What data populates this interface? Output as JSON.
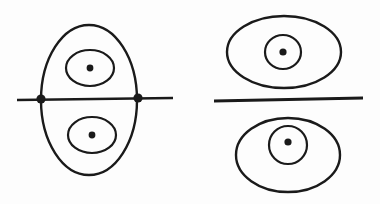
{
  "figure": {
    "name": "nodal-curve-degeneration-diagram",
    "background_color": "#fdfdfd",
    "ink_color": "#1a1a1a",
    "width": 380,
    "height": 204
  },
  "panels": [
    {
      "id": "left-panel",
      "label": "left-configuration",
      "horizontal_line": {
        "name": "left-horizontal-line",
        "x1": 17,
        "y1": 100,
        "x2": 173,
        "y2": 98,
        "stroke_width": 2.6
      },
      "outer_oval": {
        "name": "left-outer-oval",
        "cx": 89,
        "cy": 100,
        "rx": 48,
        "ry": 75,
        "stroke_width": 2.4
      },
      "nodes": [
        {
          "name": "left-node",
          "cx": 41,
          "cy": 99,
          "r": 4.6
        },
        {
          "name": "right-node",
          "cx": 138,
          "cy": 98,
          "r": 4.6
        }
      ],
      "inner_ovals": [
        {
          "name": "upper-inner-oval",
          "cx": 90,
          "cy": 68,
          "rx": 24,
          "ry": 18,
          "stroke_width": 2.2,
          "dot": {
            "name": "upper-center-dot",
            "cx": 90,
            "cy": 68,
            "r": 3.4
          }
        },
        {
          "name": "lower-inner-oval",
          "cx": 92,
          "cy": 135,
          "rx": 24,
          "ry": 18,
          "stroke_width": 2.2,
          "dot": {
            "name": "lower-center-dot",
            "cx": 92,
            "cy": 135,
            "r": 3.4
          }
        }
      ]
    },
    {
      "id": "right-panel",
      "label": "right-configuration",
      "horizontal_line": {
        "name": "right-horizontal-line",
        "x1": 214,
        "y1": 101,
        "x2": 363,
        "y2": 98,
        "stroke_width": 2.8
      },
      "ovals": [
        {
          "name": "upper-outer-oval",
          "cx": 284,
          "cy": 52,
          "rx": 57,
          "ry": 36,
          "stroke_width": 2.4,
          "inner": {
            "name": "upper-inner-circle",
            "cx": 283,
            "cy": 52,
            "rx": 18,
            "ry": 17,
            "stroke_width": 2.2
          },
          "dot": {
            "name": "upper-center-dot",
            "cx": 283,
            "cy": 52,
            "r": 3.6
          }
        },
        {
          "name": "lower-outer-oval",
          "cx": 288,
          "cy": 155,
          "rx": 52,
          "ry": 37,
          "stroke_width": 2.4,
          "inner": {
            "name": "lower-inner-circle",
            "cx": 288,
            "cy": 145,
            "rx": 19,
            "ry": 19,
            "stroke_width": 2.2
          },
          "dot": {
            "name": "lower-center-dot",
            "cx": 288,
            "cy": 142,
            "r": 3.6
          }
        }
      ]
    }
  ]
}
